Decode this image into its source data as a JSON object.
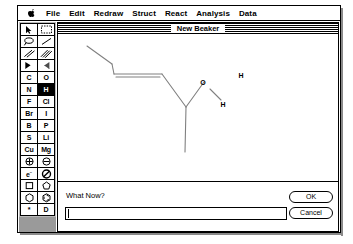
{
  "app": {
    "window_title": "New Beaker"
  },
  "menubar": {
    "apple_icon": "apple-icon",
    "items": [
      {
        "label": "File"
      },
      {
        "label": "Edit"
      },
      {
        "label": "Redraw"
      },
      {
        "label": "Struct"
      },
      {
        "label": "React"
      },
      {
        "label": "Analysis"
      },
      {
        "label": "Data"
      }
    ]
  },
  "palette": {
    "selected_tool": "H",
    "cells": [
      {
        "name": "pointer-tool",
        "kind": "icon",
        "icon": "arrow-cursor-icon",
        "selected": false
      },
      {
        "name": "marquee-select-tool",
        "kind": "icon",
        "icon": "dashed-rectangle-icon",
        "selected": false
      },
      {
        "name": "lasso-tool",
        "kind": "icon",
        "icon": "lasso-icon",
        "selected": false
      },
      {
        "name": "single-bond-tool",
        "kind": "icon",
        "icon": "single-bond-icon",
        "selected": false
      },
      {
        "name": "double-bond-tool",
        "kind": "icon",
        "icon": "double-bond-icon",
        "selected": false
      },
      {
        "name": "triple-bond-tool",
        "kind": "icon",
        "icon": "triple-bond-icon",
        "selected": false
      },
      {
        "name": "wedge-bond-tool",
        "kind": "icon",
        "icon": "wedge-bond-icon",
        "selected": false
      },
      {
        "name": "hash-bond-tool",
        "kind": "icon",
        "icon": "hashed-wedge-bond-icon",
        "selected": false
      },
      {
        "name": "element-c",
        "kind": "text",
        "label": "C",
        "selected": false
      },
      {
        "name": "element-o",
        "kind": "text",
        "label": "O",
        "selected": false
      },
      {
        "name": "element-n",
        "kind": "text",
        "label": "N",
        "selected": false
      },
      {
        "name": "element-h",
        "kind": "text",
        "label": "H",
        "selected": true
      },
      {
        "name": "element-f",
        "kind": "text",
        "label": "F",
        "selected": false
      },
      {
        "name": "element-cl",
        "kind": "text",
        "label": "Cl",
        "selected": false
      },
      {
        "name": "element-br",
        "kind": "text",
        "label": "Br",
        "selected": false
      },
      {
        "name": "element-i",
        "kind": "text",
        "label": "I",
        "selected": false
      },
      {
        "name": "element-b",
        "kind": "text",
        "label": "B",
        "selected": false
      },
      {
        "name": "element-p",
        "kind": "text",
        "label": "P",
        "selected": false
      },
      {
        "name": "element-s",
        "kind": "text",
        "label": "S",
        "selected": false
      },
      {
        "name": "element-li",
        "kind": "text",
        "label": "Li",
        "selected": false
      },
      {
        "name": "element-cu",
        "kind": "text",
        "label": "Cu",
        "selected": false
      },
      {
        "name": "element-mg",
        "kind": "text",
        "label": "Mg",
        "selected": false
      },
      {
        "name": "positive-charge-tool",
        "kind": "icon",
        "icon": "plus-circle-icon",
        "selected": false
      },
      {
        "name": "negative-charge-tool",
        "kind": "icon",
        "icon": "minus-circle-icon",
        "selected": false
      },
      {
        "name": "electron-tool",
        "kind": "text",
        "label": "e-",
        "selected": false
      },
      {
        "name": "erase-tool",
        "kind": "icon",
        "icon": "no-entry-slash-icon",
        "selected": false
      },
      {
        "name": "cyclobutane-tool",
        "kind": "icon",
        "icon": "square-ring-icon",
        "selected": false
      },
      {
        "name": "cyclopentane-tool",
        "kind": "icon",
        "icon": "pentagon-ring-icon",
        "selected": false
      },
      {
        "name": "cyclohexane-tool",
        "kind": "icon",
        "icon": "hexagon-ring-icon",
        "selected": false
      },
      {
        "name": "benzene-tool",
        "kind": "icon",
        "icon": "benzene-ring-icon",
        "selected": false
      },
      {
        "name": "radical-tool",
        "kind": "text",
        "label": "*",
        "selected": false
      },
      {
        "name": "deuterium-tool",
        "kind": "text",
        "label": "D",
        "selected": false
      }
    ]
  },
  "canvas": {
    "structure_name": "molecular-structure",
    "atom_labels": [
      {
        "text": "O",
        "x": 186,
        "y": 103
      },
      {
        "text": "H",
        "x": 203,
        "y": 122
      },
      {
        "text": "H",
        "x": 221,
        "y": 99
      }
    ]
  },
  "prompt": {
    "label": "What Now?",
    "input_value": "",
    "input_placeholder": "",
    "ok_label": "OK",
    "cancel_label": "Cancel"
  },
  "colors": {
    "window_bg": "#ffffff",
    "palette_bg": "#b9b9b9",
    "border": "#000000",
    "selected_cell_bg": "#000000",
    "bond_stroke": "#808080"
  }
}
